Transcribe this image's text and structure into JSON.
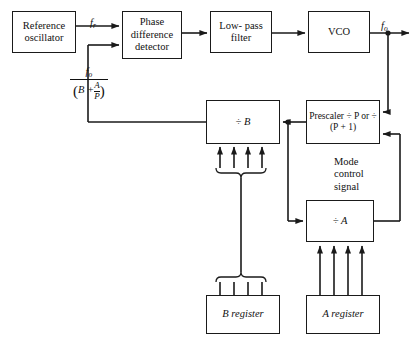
{
  "diagram": {
    "type": "block-diagram",
    "line_color": "#1a1a1a",
    "background": "#ffffff",
    "blocks": [
      {
        "id": "reference-oscillator",
        "label": "Reference\noscillator",
        "x": 12,
        "y": 11,
        "w": 64,
        "h": 42
      },
      {
        "id": "phase-difference-detector",
        "label": "Phase\ndifference\ndetector",
        "x": 122,
        "y": 11,
        "w": 60,
        "h": 48
      },
      {
        "id": "low-pass-filter",
        "label": "Low-\npass\nfilter",
        "x": 210,
        "y": 11,
        "w": 62,
        "h": 42
      },
      {
        "id": "vco",
        "label": "VCO",
        "x": 308,
        "y": 11,
        "w": 62,
        "h": 42
      },
      {
        "id": "divide-by-b",
        "label": "÷ B",
        "x": 206,
        "y": 100,
        "w": 74,
        "h": 44
      },
      {
        "id": "prescaler",
        "label": "Prescaler\n÷ P\nor ÷ (P + 1)",
        "x": 306,
        "y": 100,
        "w": 74,
        "h": 44
      },
      {
        "id": "divide-by-a",
        "label": "÷ A",
        "x": 306,
        "y": 200,
        "w": 68,
        "h": 42
      },
      {
        "id": "b-register",
        "label": "B register",
        "x": 206,
        "y": 295,
        "w": 74,
        "h": 39
      },
      {
        "id": "a-register",
        "label": "A register",
        "x": 306,
        "y": 295,
        "w": 74,
        "h": 39
      }
    ],
    "labels": {
      "f_r": {
        "text": "f",
        "sub": "r",
        "x": 92,
        "y": 6
      },
      "f_o_out": {
        "text": "f",
        "sub": "o",
        "x": 381,
        "y": 8
      },
      "feedback_numerator": {
        "text": "f",
        "sub": "o",
        "x": 92,
        "y": 68
      },
      "feedback_denominator": {
        "lead": "B  +",
        "frac_top": "A",
        "frac_bottom": "P"
      },
      "mode_control_signal": {
        "text": "Mode\ncontrol\nsignal",
        "x": 334,
        "y": 158
      }
    },
    "bus": {
      "divide_b_inputs": 4,
      "divide_a_inputs": 4,
      "b_register_outputs": 4,
      "a_register_outputs": 4
    }
  }
}
